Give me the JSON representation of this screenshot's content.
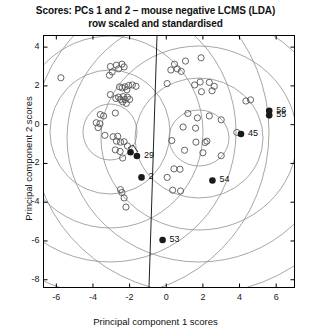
{
  "title": {
    "line1": "Scores: PCs 1 and 2 – mouse negative LCMS (LDA)",
    "line2": "row scaled and standardised"
  },
  "axes": {
    "xlabel": "Principal component 1 scores",
    "ylabel": "Principal component 2 scores",
    "xticks": [
      "-6",
      "-4",
      "-2",
      "0",
      "2",
      "4",
      "6"
    ],
    "yticks": [
      "4",
      "2",
      "0",
      "-2",
      "-4",
      "-6",
      "-8"
    ]
  },
  "colors": {
    "axis": "#000000",
    "contour": "#8a8a8a",
    "boundary": "#222222",
    "open_marker_stroke": "#555555",
    "filled_marker": "#1a1a1a",
    "background": "#ffffff",
    "title_text": "#101010"
  },
  "chart_data": {
    "type": "scatter",
    "title": "Scores: PCs 1 and 2 – mouse negative LCMS (LDA) row scaled and standardised",
    "xlabel": "Principal component 1 scores",
    "ylabel": "Principal component 2 scores",
    "xlim": [
      -6.7,
      7.0
    ],
    "ylim": [
      -8.4,
      4.6
    ],
    "xticks": [
      -6,
      -4,
      -2,
      0,
      2,
      4,
      6
    ],
    "yticks": [
      4,
      2,
      0,
      -2,
      -4,
      -6,
      -8
    ],
    "grid": false,
    "legend": false,
    "series": [
      {
        "name": "unlabelled samples",
        "marker": "open-circle",
        "points": [
          [
            -5.75,
            2.42
          ],
          [
            -3.05,
            3.0
          ],
          [
            -2.72,
            3.07
          ],
          [
            -2.42,
            3.12
          ],
          [
            -2.6,
            2.88
          ],
          [
            -2.95,
            2.72
          ],
          [
            -3.1,
            2.55
          ],
          [
            -2.3,
            2.98
          ],
          [
            -2.55,
            1.95
          ],
          [
            -2.4,
            1.9
          ],
          [
            -2.25,
            1.95
          ],
          [
            -2.05,
            2.02
          ],
          [
            -1.85,
            2.05
          ],
          [
            -1.65,
            1.98
          ],
          [
            -2.15,
            1.8
          ],
          [
            -3.05,
            1.55
          ],
          [
            -2.75,
            1.35
          ],
          [
            -2.6,
            1.42
          ],
          [
            -2.5,
            1.3
          ],
          [
            -2.35,
            1.45
          ],
          [
            -2.25,
            1.3
          ],
          [
            -2.12,
            1.42
          ],
          [
            -2.0,
            1.3
          ],
          [
            -2.38,
            1.18
          ],
          [
            -2.18,
            1.1
          ],
          [
            -3.6,
            0.52
          ],
          [
            -3.42,
            0.45
          ],
          [
            -2.78,
            0.6
          ],
          [
            -3.82,
            0.1
          ],
          [
            -3.62,
            0.05
          ],
          [
            -3.72,
            -0.15
          ],
          [
            -3.35,
            -0.55
          ],
          [
            -2.9,
            -0.62
          ],
          [
            -2.65,
            -0.6
          ],
          [
            -2.72,
            -0.85
          ],
          [
            -2.5,
            -0.9
          ],
          [
            -2.3,
            -0.88
          ],
          [
            -2.12,
            -1.1
          ],
          [
            -2.78,
            -1.3
          ],
          [
            -2.52,
            -1.38
          ],
          [
            -2.38,
            -1.72
          ],
          [
            -2.5,
            -3.35
          ],
          [
            -2.42,
            -3.5
          ],
          [
            -2.3,
            -3.78
          ],
          [
            -2.2,
            -4.25
          ],
          [
            0.45,
            3.12
          ],
          [
            1.05,
            3.28
          ],
          [
            1.9,
            3.45
          ],
          [
            0.25,
            2.82
          ],
          [
            0.6,
            2.88
          ],
          [
            0.82,
            2.75
          ],
          [
            0.05,
            2.12
          ],
          [
            1.55,
            2.05
          ],
          [
            1.85,
            2.2
          ],
          [
            2.35,
            2.18
          ],
          [
            2.62,
            1.98
          ],
          [
            2.5,
            1.75
          ],
          [
            1.92,
            1.7
          ],
          [
            4.6,
            1.28
          ],
          [
            4.35,
            1.22
          ],
          [
            1.18,
            0.58
          ],
          [
            2.35,
            0.45
          ],
          [
            1.7,
            0.35
          ],
          [
            3.0,
            0.25
          ],
          [
            0.92,
            -0.12
          ],
          [
            1.6,
            -0.18
          ],
          [
            3.85,
            -0.4
          ],
          [
            0.3,
            -0.82
          ],
          [
            1.62,
            -0.9
          ],
          [
            2.12,
            -0.92
          ],
          [
            2.22,
            -0.85
          ],
          [
            1.0,
            -1.32
          ],
          [
            2.0,
            -1.45
          ],
          [
            3.0,
            -1.6
          ],
          [
            0.42,
            -2.28
          ],
          [
            0.75,
            -2.3
          ],
          [
            0.05,
            -2.72
          ],
          [
            0.35,
            -3.38
          ],
          [
            0.78,
            -3.42
          ]
        ]
      },
      {
        "name": "highlighted samples",
        "marker": "filled-circle",
        "points": [
          {
            "x": -1.95,
            "y": -1.42,
            "label": ""
          },
          {
            "x": -1.6,
            "y": -1.62,
            "label": "29"
          },
          {
            "x": -1.35,
            "y": -2.72,
            "label": "2"
          },
          {
            "x": 5.62,
            "y": 0.72,
            "label": "56"
          },
          {
            "x": 5.62,
            "y": 0.48,
            "label": "55"
          },
          {
            "x": 4.08,
            "y": -0.48,
            "label": "45"
          },
          {
            "x": 2.52,
            "y": -2.88,
            "label": "54"
          },
          {
            "x": -0.2,
            "y": -5.95,
            "label": "53"
          }
        ]
      }
    ],
    "contours": {
      "description": "Two sets of concentric elliptical density contours plus a near-vertical linear discriminant boundary",
      "groups": [
        {
          "name": "left-group",
          "center": [
            -2.35,
            -0.05
          ],
          "levels": 4
        },
        {
          "name": "right-group",
          "center": [
            2.3,
            -0.35
          ],
          "levels": 4
        }
      ],
      "boundary": {
        "name": "lda-decision-boundary",
        "x_top": 0.1,
        "x_bottom": -0.35
      }
    }
  }
}
